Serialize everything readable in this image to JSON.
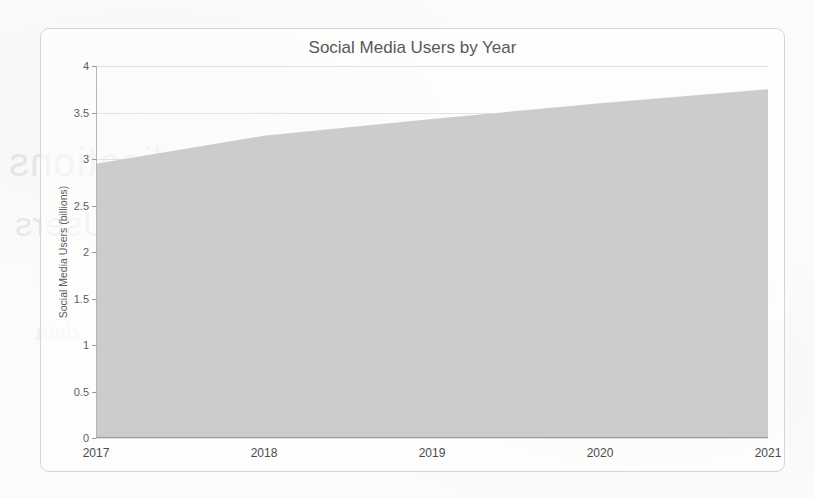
{
  "chart_data": {
    "type": "area",
    "title": "Social Media Users by Year",
    "xlabel": "",
    "ylabel": "Social Media Users (billions)",
    "x": [
      "2017",
      "2018",
      "2019",
      "2020",
      "2021"
    ],
    "categories": [
      "2017",
      "2018",
      "2019",
      "2020",
      "2021"
    ],
    "values": [
      2.95,
      3.25,
      3.43,
      3.6,
      3.75
    ],
    "series": [
      {
        "name": "Social Media Users (billions)",
        "values": [
          2.95,
          3.25,
          3.43,
          3.6,
          3.75
        ]
      }
    ],
    "ylim": [
      0,
      4
    ],
    "yticks": [
      "0",
      "0.5",
      "1",
      "1.5",
      "2",
      "2.5",
      "3",
      "3.5",
      "4"
    ],
    "ytick_values": [
      0,
      0.5,
      1,
      1.5,
      2,
      2.5,
      3,
      3.5,
      4
    ],
    "xticks": [
      "2017",
      "2018",
      "2019",
      "2020",
      "2021"
    ],
    "grid": true,
    "legend": false,
    "legend_position": "none",
    "colors": {
      "area_fill": "#c9c9c9",
      "grid": "#e2e2e4",
      "axis": "#9a9a9c",
      "title_text": "#595959",
      "tick_text": "#4a4a4a"
    }
  },
  "card": {
    "title": "Social Media Users by Year"
  },
  "background_ghost_text": {
    "line1_left": "Applications",
    "line1_right": "Active",
    "line2": "Users",
    "line3": "by",
    "line4": "data",
    "line5": "chart"
  }
}
